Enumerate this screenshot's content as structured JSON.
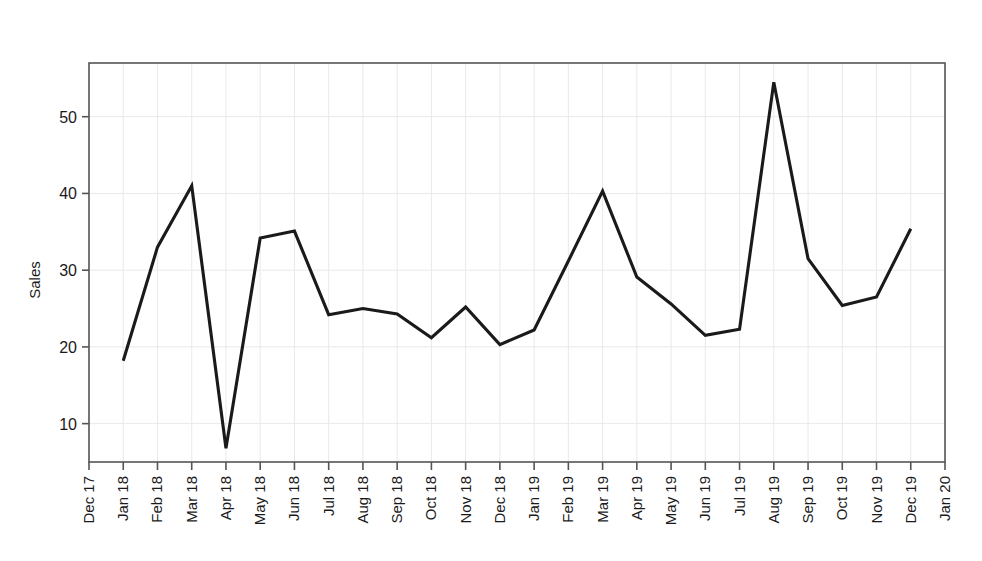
{
  "chart_data": {
    "type": "line",
    "title": "Monthly sales data",
    "xlabel": "",
    "ylabel": "Sales",
    "grid": true,
    "legend": null,
    "ylim": [
      5,
      57
    ],
    "yticks": [
      10,
      20,
      30,
      40,
      50
    ],
    "axis_range_x": [
      "Dec 17",
      "Jan 20"
    ],
    "xticks": [
      "Dec 17",
      "Jan 18",
      "Feb 18",
      "Mar 18",
      "Apr 18",
      "May 18",
      "Jun 18",
      "Jul 18",
      "Aug 18",
      "Sep 18",
      "Oct 18",
      "Nov 18",
      "Dec 18",
      "Jan 19",
      "Feb 19",
      "Mar 19",
      "Apr 19",
      "May 19",
      "Jun 19",
      "Jul 19",
      "Aug 19",
      "Sep 19",
      "Oct 19",
      "Nov 19",
      "Dec 19",
      "Jan 20"
    ],
    "categories": [
      "Jan 18",
      "Feb 18",
      "Mar 18",
      "Apr 18",
      "May 18",
      "Jun 18",
      "Jul 18",
      "Aug 18",
      "Sep 18",
      "Oct 18",
      "Nov 18",
      "Dec 18",
      "Jan 19",
      "Feb 19",
      "Mar 19",
      "Apr 19",
      "May 19",
      "Jun 19",
      "Jul 19",
      "Aug 19",
      "Sep 19",
      "Oct 19",
      "Nov 19",
      "Dec 19"
    ],
    "values": [
      18.2,
      33.0,
      41.0,
      6.8,
      34.2,
      35.1,
      24.2,
      25.0,
      24.3,
      21.2,
      25.2,
      20.3,
      22.2,
      31.2,
      40.3,
      29.1,
      25.6,
      21.5,
      22.3,
      54.5,
      31.5,
      25.4,
      26.5,
      35.4
    ],
    "line_color": "#1a1a1a",
    "line_width": 3.1,
    "grid_color": "#e9e9e9",
    "frame_color": "#555555",
    "background": "#ffffff"
  }
}
